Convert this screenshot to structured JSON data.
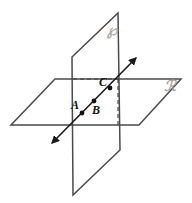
{
  "figure": {
    "canvas": {
      "width": 192,
      "height": 203,
      "background": "#ffffff"
    },
    "colors": {
      "edge": "#4a4a4a",
      "hidden_edge": "#3a3a3a",
      "line": "#1a1a1a",
      "point": "#111111",
      "plane_label": "#a8a8a8"
    },
    "planes": [
      {
        "id": "plane-p",
        "label": "℘",
        "label_text": "P",
        "orientation": "vertical",
        "label_x": 107,
        "label_y": 35,
        "vertices": "72,57 118,13 120,150 73,195"
      },
      {
        "id": "plane-r",
        "label": "ℛ",
        "label_text": "R",
        "orientation": "horizontal",
        "label_x": 164,
        "label_y": 91,
        "vertices": "55,79 181,79 139,125 11,125"
      }
    ],
    "hidden_edges": [
      {
        "id": "dashed-horizontal",
        "x1": 73,
        "y1": 79,
        "x2": 118,
        "y2": 79
      },
      {
        "id": "dashed-vertical",
        "x1": 118,
        "y1": 79,
        "x2": 118,
        "y2": 126
      }
    ],
    "ray": {
      "id": "line-abc",
      "x1": 52,
      "y1": 143,
      "x2": 136,
      "y2": 58,
      "arrow_start": true,
      "arrow_end": true
    },
    "points": [
      {
        "id": "point-a",
        "label": "A",
        "cx": 82,
        "cy": 113,
        "r": 2.4,
        "label_x": 71,
        "label_y": 109
      },
      {
        "id": "point-b",
        "label": "B",
        "cx": 94,
        "cy": 101,
        "r": 2.4,
        "label_x": 92,
        "label_y": 114
      },
      {
        "id": "point-c",
        "label": "C",
        "cx": 110,
        "cy": 88,
        "r": 2.4,
        "label_x": 99,
        "label_y": 86
      }
    ]
  }
}
